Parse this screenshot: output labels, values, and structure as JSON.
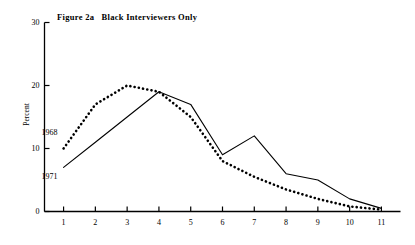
{
  "chart_data": {
    "type": "line",
    "title": "Figure 2a   Black Interviewers Only",
    "xlabel": "",
    "ylabel": "Percent",
    "xlim": [
      0.4,
      11.6
    ],
    "ylim": [
      0,
      30
    ],
    "grid": false,
    "legend_position": "inline-annotation",
    "x": [
      1,
      2,
      3,
      4,
      5,
      6,
      7,
      8,
      9,
      10,
      11
    ],
    "xticks": [
      "1",
      "2",
      "3",
      "4",
      "5",
      "6",
      "7",
      "8",
      "9",
      "10",
      "11"
    ],
    "yticks": [
      "0",
      "10",
      "20",
      "30"
    ],
    "ytick_values": [
      0,
      10,
      20,
      30
    ],
    "series": [
      {
        "name": "1968",
        "style": "dotted",
        "values": [
          10.0,
          17.0,
          20.0,
          19.0,
          15.0,
          8.0,
          5.5,
          3.5,
          2.0,
          0.8,
          0.3
        ]
      },
      {
        "name": "1971",
        "style": "solid",
        "values": [
          7.0,
          11.0,
          15.0,
          19.0,
          17.0,
          9.0,
          12.0,
          6.0,
          5.0,
          2.0,
          0.5
        ]
      }
    ],
    "annotations": [
      {
        "text": "1968",
        "x": 1.0,
        "y": 12.5
      },
      {
        "text": "1971",
        "x": 1.0,
        "y": 5.5
      }
    ],
    "colors": {
      "line": "#000000",
      "axis": "#000000",
      "background": "#ffffff"
    }
  }
}
